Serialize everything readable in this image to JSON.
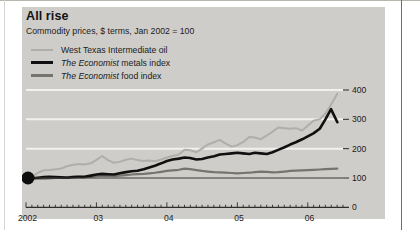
{
  "figure": {
    "title": "All rise",
    "subtitle": "Commodity prices, $ terms, Jan 2002 = 100"
  },
  "colors": {
    "panel_background": "#cfcdc9",
    "oil": "#b0aeaa",
    "metals": "#101010",
    "food": "#76746f",
    "gridline": "#f2f1ef",
    "baseline": "#3a3a38",
    "text": "#1b1b1b"
  },
  "legend": [
    {
      "key": "oil",
      "label": "West Texas Intermediate oil",
      "emphasis": "",
      "rest": "West Texas Intermediate oil"
    },
    {
      "key": "metals",
      "label": "The Economist metals index",
      "emphasis": "The Economist",
      "rest": " metals index"
    },
    {
      "key": "food",
      "label": "The Economist food index",
      "emphasis": "The Economist",
      "rest": " food index"
    }
  ],
  "chart_data": {
    "type": "line",
    "title": "All rise",
    "subtitle": "Commodity prices, $ terms, Jan 2002 = 100",
    "xlabel": "",
    "ylabel": "",
    "xlim": [
      2002.0,
      2006.5
    ],
    "ylim": [
      0,
      430
    ],
    "yticks": [
      0,
      100,
      200,
      300,
      400
    ],
    "ytick_labels": [
      "0",
      "100",
      "200",
      "300",
      "400"
    ],
    "xticks": [
      2002,
      2003,
      2004,
      2005,
      2006
    ],
    "xtick_labels": [
      "2002",
      "03",
      "04",
      "05",
      "06"
    ],
    "minor_xticks": "monthly",
    "grid": "horizontal-white-at-200-300-400",
    "baseline_value": 100,
    "legend_position": "top-left",
    "origin_marker": {
      "x": 2002.0,
      "y": 100,
      "shape": "filled-circle"
    },
    "x": [
      2002.0,
      2002.08,
      2002.17,
      2002.25,
      2002.33,
      2002.42,
      2002.5,
      2002.58,
      2002.67,
      2002.75,
      2002.83,
      2002.92,
      2003.0,
      2003.08,
      2003.17,
      2003.25,
      2003.33,
      2003.42,
      2003.5,
      2003.58,
      2003.67,
      2003.75,
      2003.83,
      2003.92,
      2004.0,
      2004.08,
      2004.17,
      2004.25,
      2004.33,
      2004.42,
      2004.5,
      2004.58,
      2004.67,
      2004.75,
      2004.83,
      2004.92,
      2005.0,
      2005.08,
      2005.17,
      2005.25,
      2005.33,
      2005.42,
      2005.5,
      2005.58,
      2005.67,
      2005.75,
      2005.83,
      2005.92,
      2006.0,
      2006.08,
      2006.17,
      2006.25,
      2006.33,
      2006.42
    ],
    "series": [
      {
        "name": "West Texas Intermediate oil",
        "color": "#b0aeaa",
        "values": [
          100,
          104,
          118,
          126,
          127,
          130,
          132,
          140,
          145,
          148,
          146,
          150,
          162,
          175,
          160,
          152,
          155,
          162,
          166,
          161,
          158,
          160,
          157,
          163,
          170,
          175,
          180,
          196,
          195,
          188,
          200,
          214,
          222,
          230,
          218,
          207,
          212,
          222,
          240,
          238,
          232,
          245,
          258,
          272,
          270,
          268,
          270,
          262,
          278,
          295,
          300,
          320,
          350,
          388
        ]
      },
      {
        "name": "The Economist metals index",
        "color": "#101010",
        "values": [
          100,
          99,
          101,
          103,
          104,
          103,
          102,
          101,
          103,
          104,
          104,
          108,
          112,
          114,
          113,
          112,
          116,
          120,
          123,
          125,
          130,
          136,
          142,
          150,
          158,
          163,
          166,
          170,
          168,
          163,
          165,
          170,
          174,
          180,
          182,
          184,
          186,
          184,
          182,
          186,
          184,
          182,
          188,
          196,
          205,
          214,
          222,
          232,
          242,
          252,
          268,
          300,
          335,
          290
        ]
      },
      {
        "name": "The Economist food index",
        "color": "#76746f",
        "values": [
          100,
          99,
          98,
          98,
          99,
          100,
          101,
          103,
          104,
          104,
          103,
          104,
          106,
          108,
          107,
          106,
          108,
          110,
          112,
          113,
          114,
          116,
          118,
          121,
          124,
          126,
          128,
          132,
          130,
          127,
          124,
          122,
          120,
          119,
          118,
          117,
          116,
          117,
          118,
          120,
          122,
          121,
          119,
          120,
          122,
          124,
          125,
          126,
          127,
          128,
          129,
          130,
          131,
          132
        ]
      }
    ]
  }
}
